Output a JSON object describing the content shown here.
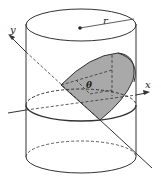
{
  "diagram": {
    "type": "cylinder-wedge",
    "labels": {
      "radius": "r",
      "angle": "θ",
      "x_axis": "x",
      "y_axis": "y"
    },
    "colors": {
      "stroke": "#333333",
      "wedge_fill": "#a9a9a9",
      "background": "#ffffff"
    }
  }
}
